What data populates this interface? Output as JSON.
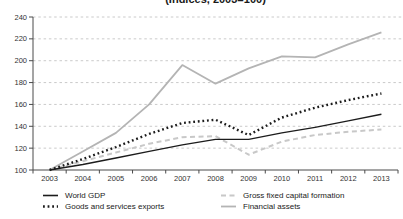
{
  "title": "(Indices, 2003=100)",
  "chart_data": {
    "type": "line",
    "x": [
      2003,
      2004,
      2005,
      2006,
      2007,
      2008,
      2009,
      2010,
      2011,
      2012,
      2013
    ],
    "series": [
      {
        "name": "World GDP",
        "values": [
          100,
          105,
          111,
          117,
          123,
          128,
          128,
          134,
          139,
          145,
          151
        ],
        "color": "#1c1c1c",
        "style": "solid",
        "width": 1.4
      },
      {
        "name": "Goods and services exports",
        "values": [
          100,
          110,
          121,
          133,
          143,
          146,
          132,
          148,
          157,
          164,
          170
        ],
        "color": "#1c1c1c",
        "style": "dotted",
        "width": 2.4
      },
      {
        "name": "Gross fixed capital formation",
        "values": [
          100,
          108,
          116,
          124,
          130,
          131,
          114,
          126,
          132,
          135,
          137
        ],
        "color": "#c8c8c8",
        "style": "dashed",
        "width": 2
      },
      {
        "name": "Financial assets",
        "values": [
          100,
          117,
          134,
          160,
          196,
          179,
          193,
          204,
          203,
          215,
          226
        ],
        "color": "#b4b4b4",
        "style": "solid",
        "width": 1.8
      }
    ],
    "ylim": [
      100,
      240
    ],
    "yticks": [
      100,
      120,
      140,
      160,
      180,
      200,
      220,
      240
    ],
    "grid": "horizontal-dashed",
    "legend_position": "bottom",
    "colors": {
      "gridline": "#bdbdbd",
      "axis": "#4a4a4a",
      "tick_label": "#333333"
    }
  }
}
